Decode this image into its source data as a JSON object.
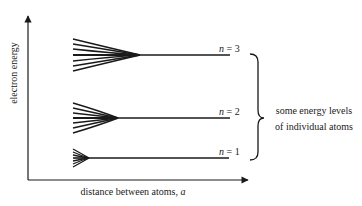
{
  "diagram": {
    "y_axis_label": "electron energy",
    "x_axis_label": "distance between atoms,",
    "x_axis_var": "a",
    "levels": [
      {
        "n_label": "n",
        "eq": " = 3",
        "lines": 7
      },
      {
        "n_label": "n",
        "eq": " = 2",
        "lines": 7
      },
      {
        "n_label": "n",
        "eq": " = 1",
        "lines": 7
      }
    ],
    "brace_text_line1": "some energy levels",
    "brace_text_line2": "of individual atoms"
  },
  "colors": {
    "ink": "#1a1a1a",
    "background": "#ffffff"
  }
}
